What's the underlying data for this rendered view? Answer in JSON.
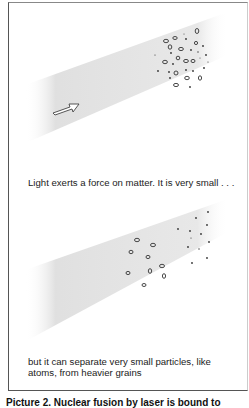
{
  "figure": {
    "panel_top": {
      "label": "light-beam-with-mixed-particles",
      "arrow": "arrow-right-icon",
      "text": "Light exerts a force on matter. It is very small . . ."
    },
    "panel_bottom": {
      "label": "light-beam-with-separated-particles",
      "text_line1": "but it can separate  very small particles, like",
      "text_line2": "atoms, from heavier grains"
    },
    "caption": {
      "label": "Picture 2.",
      "text": "Nuclear fusion by laser is bound to"
    },
    "colors": {
      "beam": "#d9d9d9",
      "frame": "#555555",
      "particle_outline": "#333333"
    }
  }
}
